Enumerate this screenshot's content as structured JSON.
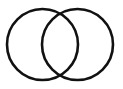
{
  "diagram": {
    "type": "venn",
    "sets": [
      {
        "name": "left-set",
        "cx": 42.5,
        "cy": 44.5,
        "r": 35.5
      },
      {
        "name": "right-set",
        "cx": 77.5,
        "cy": 44.5,
        "r": 35.5
      }
    ],
    "stroke_color": "#111111",
    "background": "#ffffff"
  }
}
